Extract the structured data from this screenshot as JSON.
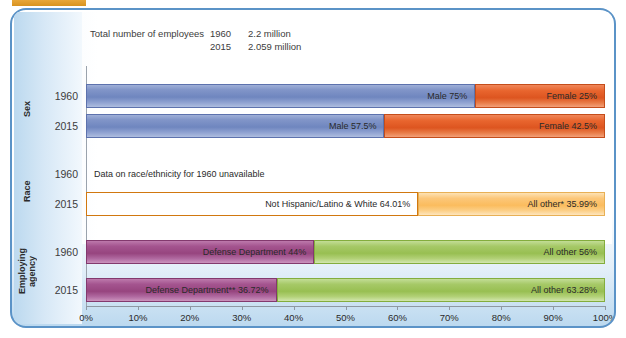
{
  "figure": {
    "header": {
      "label": "Total number of employees",
      "rows": [
        {
          "year": "1960",
          "value": "2.2 million"
        },
        {
          "year": "2015",
          "value": "2.059 million"
        }
      ]
    },
    "categories": [
      {
        "key": "sex",
        "label": "Sex"
      },
      {
        "key": "race",
        "label": "Race"
      },
      {
        "key": "agency",
        "label": "Employing agency"
      }
    ],
    "note": "Data on race/ethnicity for 1960 unavailable"
  },
  "chart_data": {
    "type": "bar",
    "orientation": "horizontal",
    "stacked": true,
    "normalized": true,
    "title": "",
    "xlabel": "",
    "ylabel": "",
    "xlim": [
      0,
      100
    ],
    "xticks": [
      "0%",
      "10%",
      "20%",
      "30%",
      "40%",
      "50%",
      "60%",
      "70%",
      "80%",
      "90%",
      "100%"
    ],
    "xtick_values": [
      0,
      10,
      20,
      30,
      40,
      50,
      60,
      70,
      80,
      90,
      100
    ],
    "grid": false,
    "legend": "inline-labels",
    "groups": [
      {
        "name": "Sex",
        "rows": [
          {
            "year": "1960",
            "segments": [
              {
                "name": "Male",
                "value": 75,
                "label": "Male 75%",
                "color": "#7b8ec4"
              },
              {
                "name": "Female",
                "value": 25,
                "label": "Female 25%",
                "color": "#e8622c"
              }
            ]
          },
          {
            "year": "2015",
            "segments": [
              {
                "name": "Male",
                "value": 57.5,
                "label": "Male 57.5%",
                "color": "#7b8ec4"
              },
              {
                "name": "Female",
                "value": 42.5,
                "label": "Female 42.5%",
                "color": "#e8622c"
              }
            ]
          }
        ]
      },
      {
        "name": "Race",
        "rows": [
          {
            "year": "1960",
            "unavailable": true,
            "note": "Data on race/ethnicity for 1960 unavailable",
            "segments": []
          },
          {
            "year": "2015",
            "segments": [
              {
                "name": "Not Hispanic/Latino & White",
                "value": 64.01,
                "label": "Not Hispanic/Latino & White 64.01%",
                "color": "#ee8420"
              },
              {
                "name": "All other*",
                "value": 35.99,
                "label": "All other* 35.99%",
                "color": "#fac36a"
              }
            ]
          }
        ]
      },
      {
        "name": "Employing agency",
        "rows": [
          {
            "year": "1960",
            "segments": [
              {
                "name": "Defense Department",
                "value": 44,
                "label": "Defense Department 44%",
                "color": "#a0508c"
              },
              {
                "name": "All other",
                "value": 56,
                "label": "All other 56%",
                "color": "#9bc25c"
              }
            ]
          },
          {
            "year": "2015",
            "segments": [
              {
                "name": "Defense Department**",
                "value": 36.72,
                "label": "Defense Department** 36.72%",
                "color": "#a0508c"
              },
              {
                "name": "All other",
                "value": 63.28,
                "label": "All other 63.28%",
                "color": "#9bc25c"
              }
            ]
          }
        ]
      }
    ]
  },
  "colors": {
    "panel_border": "#5b93c7",
    "panel_background": "#bcd9ef",
    "gold_tab": "#d89320",
    "blue": "#7b8ec4",
    "orange_red": "#e8622c",
    "orange": "#ee8420",
    "light_orange": "#fac36a",
    "purple": "#a0508c",
    "green": "#9bc25c"
  }
}
